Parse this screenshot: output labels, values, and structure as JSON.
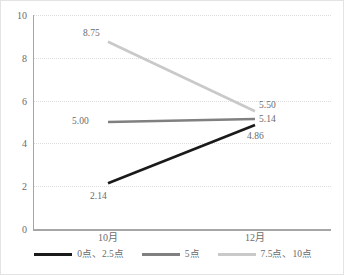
{
  "chart_data": {
    "type": "line",
    "title": "",
    "xlabel": "",
    "ylabel": "",
    "categories": [
      "10月",
      "12月"
    ],
    "ylim": [
      0,
      10
    ],
    "yticks": [
      0,
      2,
      4,
      6,
      8,
      10
    ],
    "ytick_labels": [
      "0",
      "2",
      "4",
      "6",
      "8",
      "10"
    ],
    "grid": true,
    "legend_position": "bottom",
    "series": [
      {
        "name": "0点、2.5点",
        "color": "#1a1a1a",
        "values": [
          2.14,
          4.86
        ],
        "labels": [
          "2.14",
          "4.86"
        ]
      },
      {
        "name": "5点",
        "color": "#808080",
        "values": [
          5.0,
          5.14
        ],
        "labels": [
          "5.00",
          "5.14"
        ]
      },
      {
        "name": "7.5点、10点",
        "color": "#c9c9c9",
        "values": [
          8.75,
          5.5
        ],
        "labels": [
          "8.75",
          "5.50"
        ]
      }
    ]
  },
  "axis": {
    "y": {
      "t0": "0",
      "t1": "2",
      "t2": "4",
      "t3": "6",
      "t4": "8",
      "t5": "10"
    },
    "x": {
      "t0": "10月",
      "t1": "12月"
    }
  },
  "point_labels": {
    "light_start": "8.75",
    "light_end": "5.50",
    "gray_start": "5.00",
    "gray_end": "5.14",
    "dark_start": "2.14",
    "dark_end": "4.86"
  },
  "legend": {
    "items": [
      {
        "label": "0点、2.5点",
        "color": "#1a1a1a"
      },
      {
        "label": "5点",
        "color": "#808080"
      },
      {
        "label": "7.5点、10点",
        "color": "#c9c9c9"
      }
    ]
  },
  "colors": {
    "dark": "#1a1a1a",
    "gray": "#808080",
    "light": "#c9c9c9",
    "axis": "#a6a6a6",
    "grid": "#dcdcdc",
    "text": "#6b6b6b",
    "background": "#ffffff",
    "border": "#e3e3e3"
  }
}
